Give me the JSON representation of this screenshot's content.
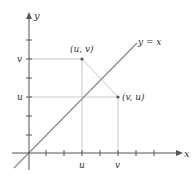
{
  "diagram": {
    "axes": {
      "x_label": "x",
      "y_label": "y"
    },
    "line": {
      "label": "y = x",
      "color": "#8a8a8a"
    },
    "points": [
      {
        "label": "(u, v)",
        "x": "u",
        "y": "v"
      },
      {
        "label": "(v, u)",
        "x": "v",
        "y": "u"
      }
    ],
    "x_tick_labels": [
      "u",
      "v"
    ],
    "y_tick_labels": [
      "v",
      "u"
    ],
    "colors": {
      "axis": "#555555",
      "guide": "#c8c8c8",
      "point": "#555555",
      "text": "#333333"
    }
  }
}
